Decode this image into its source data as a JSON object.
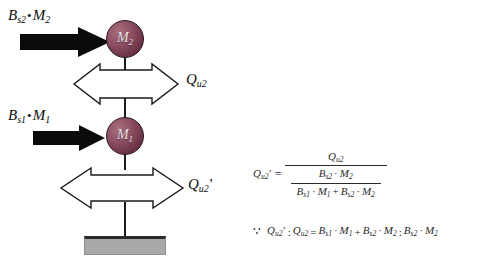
{
  "figure": {
    "type": "two-mass-shear-model",
    "background": "#ffffff",
    "mass_fill": "#8d4f62",
    "base_fill": "#a9a9a9",
    "line_color": "#1a1a1a"
  },
  "diagram": {
    "forces": [
      {
        "id": "force-top",
        "symbol": "B",
        "sub": "s2",
        "operator": "•",
        "mass_symbol": "M",
        "mass_sub": "2",
        "text": "Bs2 • M2",
        "arrow": "solid-right-arrow",
        "direction": "right"
      },
      {
        "id": "force-bottom",
        "symbol": "B",
        "sub": "s1",
        "operator": "•",
        "mass_symbol": "M",
        "mass_sub": "1",
        "text": "Bs1 • M1",
        "arrow": "solid-right-arrow",
        "direction": "right"
      }
    ],
    "masses": [
      {
        "id": "mass-2",
        "symbol": "M",
        "sub": "2"
      },
      {
        "id": "mass-1",
        "symbol": "M",
        "sub": "1"
      }
    ],
    "shears": [
      {
        "id": "shear-upper",
        "symbol": "Q",
        "sub": "u2",
        "prime": "",
        "text": "Qu2",
        "arrow": "hollow-double-arrow"
      },
      {
        "id": "shear-lower",
        "symbol": "Q",
        "sub": "u2",
        "prime": "'",
        "text": "Qu2'",
        "arrow": "hollow-double-arrow"
      }
    ],
    "base": {
      "id": "ground-base",
      "label": ""
    }
  },
  "equations": {
    "main": {
      "lhs": {
        "symbol": "Q",
        "sub": "u2",
        "prime": "'"
      },
      "equals": "=",
      "numerator": {
        "symbol": "Q",
        "sub": "u2"
      },
      "denominator": {
        "numerator": {
          "b": "B",
          "b_sub": "s2",
          "op": "·",
          "m": "M",
          "m_sub": "2"
        },
        "denominator": {
          "term1": {
            "b": "B",
            "b_sub": "s1",
            "op": "·",
            "m": "M",
            "m_sub": "1"
          },
          "plus": "+",
          "term2": {
            "b": "B",
            "b_sub": "s2",
            "op": "·",
            "m": "M",
            "m_sub": "2"
          }
        }
      },
      "plain_text": "Qu2' = Qu2 / ( (Bs2·M2) / (Bs1·M1 + Bs2·M2) )"
    },
    "conclusion": {
      "marker": "∵",
      "lhs_a": {
        "symbol": "Q",
        "sub": "u2",
        "prime": "'"
      },
      "ratio_colon": ":",
      "lhs_b": {
        "symbol": "Q",
        "sub": "u2"
      },
      "equals": "=",
      "rhs_term1": {
        "b": "B",
        "b_sub": "s1",
        "op": "·",
        "m": "M",
        "m_sub": "1"
      },
      "plus": "+",
      "rhs_term2": {
        "b": "B",
        "b_sub": "s2",
        "op": "·",
        "m": "M",
        "m_sub": "2"
      },
      "rhs_colon": ":",
      "rhs_term3": {
        "b": "B",
        "b_sub": "s2",
        "op": "·",
        "m": "M",
        "m_sub": "2"
      },
      "plain_text": "∵ Qu2' : Qu2 = Bs1·M1 + Bs2·M2 : Bs2·M2"
    }
  }
}
